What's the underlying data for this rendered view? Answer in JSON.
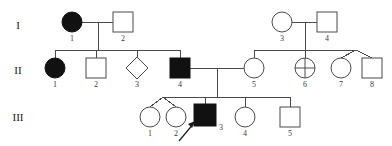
{
  "diagram": {
    "type": "pedigree-chart",
    "width": 392,
    "height": 146,
    "background_color": "#ffffff",
    "line_color": "#4a4a4a",
    "affected_fill_color": "#111111",
    "unaffected_fill_color": "#ffffff"
  },
  "generation_labels": [
    {
      "name": "generation-1",
      "text": "I",
      "x": 18,
      "y": 26
    },
    {
      "name": "generation-2",
      "text": "II",
      "x": 18,
      "y": 71
    },
    {
      "name": "generation-3",
      "text": "III",
      "x": 18,
      "y": 118
    }
  ],
  "individuals": [
    {
      "key": "I-1",
      "id_label": "1",
      "generation": "I",
      "shape": "circle",
      "status": "affected",
      "sex": "female",
      "cx": 72,
      "cy": 22,
      "r": 10,
      "label_x": 72,
      "label_y": 38
    },
    {
      "key": "I-2",
      "id_label": "2",
      "generation": "I",
      "shape": "square",
      "status": "unaffected",
      "sex": "male",
      "cx": 123,
      "cy": 22,
      "r": 10,
      "label_x": 123,
      "label_y": 38
    },
    {
      "key": "I-3",
      "id_label": "3",
      "generation": "I",
      "shape": "circle",
      "status": "unaffected",
      "sex": "female",
      "cx": 282,
      "cy": 22,
      "r": 10,
      "label_x": 282,
      "label_y": 38
    },
    {
      "key": "I-4",
      "id_label": "4",
      "generation": "I",
      "shape": "square",
      "status": "unaffected",
      "sex": "male",
      "cx": 327,
      "cy": 22,
      "r": 10,
      "label_x": 327,
      "label_y": 38
    },
    {
      "key": "II-1",
      "id_label": "1",
      "generation": "II",
      "shape": "circle",
      "status": "affected",
      "sex": "female",
      "cx": 55,
      "cy": 68,
      "r": 10,
      "label_x": 55,
      "label_y": 84
    },
    {
      "key": "II-2",
      "id_label": "2",
      "generation": "II",
      "shape": "square",
      "status": "unaffected",
      "sex": "male",
      "cx": 96,
      "cy": 68,
      "r": 10,
      "label_x": 96,
      "label_y": 84
    },
    {
      "key": "II-3",
      "id_label": "3",
      "generation": "II",
      "shape": "diamond",
      "status": "unaffected",
      "sex": "unknown",
      "cx": 137,
      "cy": 68,
      "r": 11,
      "label_x": 137,
      "label_y": 84
    },
    {
      "key": "II-4",
      "id_label": "4",
      "generation": "II",
      "shape": "square",
      "status": "affected",
      "sex": "male",
      "cx": 180,
      "cy": 68,
      "r": 10,
      "label_x": 180,
      "label_y": 84
    },
    {
      "key": "II-5",
      "id_label": "5",
      "generation": "II",
      "shape": "circle",
      "status": "unaffected",
      "sex": "female",
      "cx": 254,
      "cy": 68,
      "r": 10,
      "label_x": 254,
      "label_y": 84
    },
    {
      "key": "II-6",
      "id_label": "6",
      "generation": "II",
      "shape": "circle-crossed",
      "status": "unaffected",
      "sex": "female",
      "cx": 305,
      "cy": 68,
      "r": 10,
      "label_x": 305,
      "label_y": 84
    },
    {
      "key": "II-7",
      "id_label": "7",
      "generation": "II",
      "shape": "circle",
      "status": "unaffected",
      "sex": "female",
      "cx": 341,
      "cy": 68,
      "r": 10,
      "label_x": 341,
      "label_y": 84
    },
    {
      "key": "II-8",
      "id_label": "8",
      "generation": "II",
      "shape": "square",
      "status": "unaffected",
      "sex": "male",
      "cx": 372,
      "cy": 68,
      "r": 10,
      "label_x": 372,
      "label_y": 84
    },
    {
      "key": "III-1",
      "id_label": "1",
      "generation": "III",
      "shape": "circle",
      "status": "unaffected",
      "sex": "female",
      "cx": 150,
      "cy": 117,
      "r": 10,
      "label_x": 150,
      "label_y": 133
    },
    {
      "key": "III-2",
      "id_label": "2",
      "generation": "III",
      "shape": "circle",
      "status": "unaffected",
      "sex": "female",
      "cx": 176,
      "cy": 117,
      "r": 10,
      "label_x": 176,
      "label_y": 133
    },
    {
      "key": "III-3",
      "id_label": "3",
      "generation": "III",
      "shape": "square",
      "status": "affected",
      "sex": "male",
      "cx": 205,
      "cy": 115,
      "r": 11,
      "label_x": 218,
      "label_y": 128
    },
    {
      "key": "III-4",
      "id_label": "4",
      "generation": "III",
      "shape": "circle",
      "status": "unaffected",
      "sex": "female",
      "cx": 245,
      "cy": 117,
      "r": 10,
      "label_x": 245,
      "label_y": 133
    },
    {
      "key": "III-5",
      "id_label": "5",
      "generation": "III",
      "shape": "square",
      "status": "unaffected",
      "sex": "male",
      "cx": 290,
      "cy": 117,
      "r": 10,
      "label_x": 290,
      "label_y": 133
    }
  ],
  "matings": [
    {
      "name": "mating-I1-I2",
      "partners": [
        "I-1",
        "I-2"
      ],
      "x1": 82,
      "x2": 113,
      "y": 22
    },
    {
      "name": "mating-I3-I4",
      "partners": [
        "I-3",
        "I-4"
      ],
      "x1": 292,
      "x2": 317,
      "y": 22
    },
    {
      "name": "mating-II4-II5",
      "partners": [
        "II-4",
        "II-5"
      ],
      "x1": 190,
      "x2": 244,
      "y": 68
    }
  ],
  "sibships": [
    {
      "name": "sibship-generation-2-left",
      "parents": [
        "I-1",
        "I-2"
      ],
      "children": [
        "II-1",
        "II-2",
        "II-3",
        "II-4"
      ],
      "sib_line_y": 50,
      "sib_line_x1": 55,
      "sib_line_x2": 180,
      "descent_x": 98,
      "descent_y1": 22,
      "descent_y2": 50
    },
    {
      "name": "sibship-generation-2-right",
      "parents": [
        "I-3",
        "I-4"
      ],
      "children": [
        "II-5",
        "II-6",
        "twin-pair-II7-II8"
      ],
      "sib_line_y": 50,
      "sib_line_x1": 254,
      "sib_line_x2": 356,
      "descent_x": 305,
      "descent_y1": 22,
      "descent_y2": 50
    },
    {
      "name": "sibship-generation-3",
      "parents": [
        "II-4",
        "II-5"
      ],
      "children": [
        "twin-pair-III1-III2",
        "III-3",
        "III-4",
        "III-5"
      ],
      "sib_line_y": 97,
      "sib_line_x1": 163,
      "sib_line_x2": 290,
      "descent_x": 217,
      "descent_y1": 68,
      "descent_y2": 97
    }
  ],
  "twin_pairs": [
    {
      "name": "twin-pair-II7-II8",
      "members": [
        "II-7",
        "II-8"
      ],
      "apex_x": 356,
      "apex_y": 50
    },
    {
      "name": "twin-pair-III1-III2",
      "members": [
        "III-1",
        "III-2"
      ],
      "apex_x": 163,
      "apex_y": 97
    }
  ],
  "proband": {
    "name": "proband-arrow",
    "points_to": "III-3",
    "tail_x": 180,
    "tail_y": 140,
    "head_x": 196,
    "head_y": 122
  },
  "legend_semantics": {
    "circle": "female",
    "square": "male",
    "diamond": "sex unspecified",
    "filled": "affected",
    "open": "unaffected",
    "circle-crossed": "carrier or deceased marker",
    "arrow": "proband"
  }
}
